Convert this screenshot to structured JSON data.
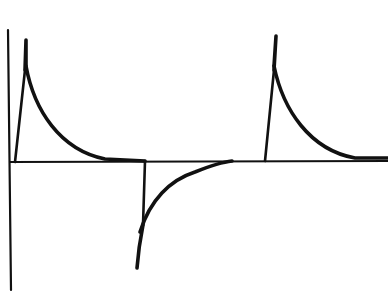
{
  "diagram": {
    "type": "waveform",
    "colors": {
      "stroke": "#111111",
      "background": "#ffffff"
    },
    "axes": {
      "vertical": {
        "x1": 8,
        "y1": 30,
        "x2": 11,
        "y2": 290
      },
      "horizontal": {
        "x1": 10,
        "y1": 162,
        "x2": 388,
        "y2": 161
      }
    },
    "pulses": [
      {
        "polarity": "positive",
        "rise_start": [
          15,
          162
        ],
        "peak": [
          25,
          40
        ],
        "decay_end": [
          108,
          160
        ],
        "baseline_end": [
          145,
          161
        ]
      },
      {
        "polarity": "negative",
        "fall_start": [
          145,
          161
        ],
        "trough": [
          137,
          268
        ],
        "recover_end": [
          230,
          160
        ]
      },
      {
        "polarity": "positive",
        "rise_start": [
          265,
          161
        ],
        "peak": [
          275,
          36
        ],
        "decay_end": [
          365,
          159
        ],
        "baseline_end": [
          388,
          158
        ]
      }
    ],
    "labels": []
  }
}
